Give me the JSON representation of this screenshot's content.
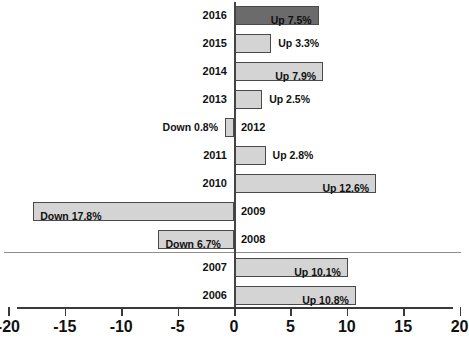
{
  "chart_data": {
    "type": "bar",
    "orientation": "horizontal",
    "title": "",
    "subtitle": "",
    "xlabel": "",
    "ylabel": "",
    "xlim": [
      -20,
      20
    ],
    "xticks": [
      -20,
      -15,
      -10,
      -5,
      0,
      5,
      10,
      15,
      20
    ],
    "xticklabels": [
      "-20",
      "-15",
      "-10",
      "-5",
      "0",
      "5",
      "10",
      "15",
      "20"
    ],
    "grid": false,
    "legend": false,
    "categories": [
      "2016",
      "2015",
      "2014",
      "2013",
      "2012",
      "2011",
      "2010",
      "2009",
      "2008",
      "2007",
      "2006"
    ],
    "values": [
      7.5,
      3.3,
      7.9,
      2.5,
      -0.8,
      2.8,
      12.6,
      -17.8,
      -6.7,
      10.1,
      10.8
    ],
    "data_labels": [
      "Up 7.5%",
      "Up 3.3%",
      "Up 7.9%",
      "Up 2.5%",
      "Down 0.8%",
      "Up 2.8%",
      "Up 12.6%",
      "Down 17.8%",
      "Down 6.7%",
      "Up 10.1%",
      "Up 10.8%"
    ],
    "highlighted": [
      "2016"
    ],
    "annotations": [
      {
        "type": "horizontal-separator",
        "between": [
          "2008",
          "2007"
        ]
      }
    ],
    "colors": {
      "bar_default": "#d4d4d4",
      "bar_highlight": "#6b6b6b",
      "bar_border": "#4a4a4a",
      "axis": "#3a3a3a",
      "separator": "#8d8d8d",
      "text": "#111111",
      "background": "#ffffff"
    }
  },
  "rows": [
    {
      "year": "2016",
      "label": "Up 7.5%",
      "value": 7.5,
      "highlight": true,
      "label_inside": true
    },
    {
      "year": "2015",
      "label": "Up 3.3%",
      "value": 3.3,
      "highlight": false,
      "label_inside": false
    },
    {
      "year": "2014",
      "label": "Up 7.9%",
      "value": 7.9,
      "highlight": false,
      "label_inside": true
    },
    {
      "year": "2013",
      "label": "Up 2.5%",
      "value": 2.5,
      "highlight": false,
      "label_inside": false
    },
    {
      "year": "2012",
      "label": "Down 0.8%",
      "value": -0.8,
      "highlight": false,
      "label_inside": false
    },
    {
      "year": "2011",
      "label": "Up 2.8%",
      "value": 2.8,
      "highlight": false,
      "label_inside": false
    },
    {
      "year": "2010",
      "label": "Up 12.6%",
      "value": 12.6,
      "highlight": false,
      "label_inside": true
    },
    {
      "year": "2009",
      "label": "Down 17.8%",
      "value": -17.8,
      "highlight": false,
      "label_inside": true
    },
    {
      "year": "2008",
      "label": "Down 6.7%",
      "value": -6.7,
      "highlight": false,
      "label_inside": true
    },
    {
      "year": "2007",
      "label": "Up 10.1%",
      "value": 10.1,
      "highlight": false,
      "label_inside": true
    },
    {
      "year": "2006",
      "label": "Up 10.8%",
      "value": 10.8,
      "highlight": false,
      "label_inside": true
    }
  ],
  "axis": {
    "ticks": [
      "-20",
      "-15",
      "-10",
      "-5",
      "0",
      "5",
      "10",
      "15",
      "20"
    ]
  }
}
